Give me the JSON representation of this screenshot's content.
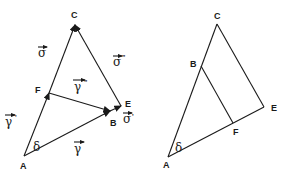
{
  "left_figure": {
    "points": {
      "A": "A",
      "B": "B",
      "C": "C",
      "E": "E",
      "F": "F"
    },
    "angle_label": "δ",
    "vectors": {
      "sigma": {
        "sym": "σ",
        "prime": ""
      },
      "sigma_dd": {
        "sym": "σ",
        "prime": "\""
      },
      "sigma_p": {
        "sym": "σ",
        "prime": "'"
      },
      "gamma": {
        "sym": "γ",
        "prime": ""
      },
      "gamma_p": {
        "sym": "γ",
        "prime": "'"
      },
      "gamma_dd": {
        "sym": "γ",
        "prime": "\""
      }
    }
  },
  "right_figure": {
    "points": {
      "A": "A",
      "B": "B",
      "C": "C",
      "E": "E",
      "F": "F"
    },
    "angle_label": "δ"
  },
  "colors": {
    "ink": "#1a1a1a",
    "background": "#ffffff"
  }
}
